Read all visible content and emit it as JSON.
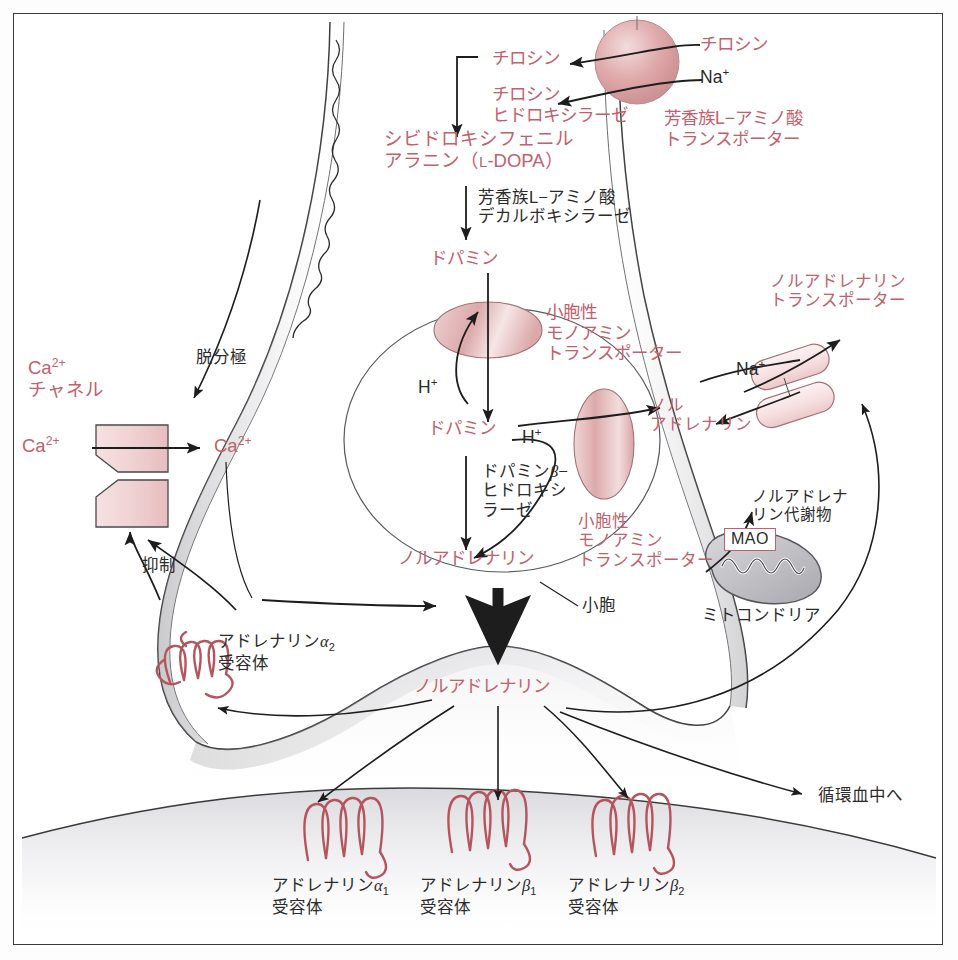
{
  "figure": {
    "type": "diagram",
    "accent_pink": "#c2606c",
    "ink": "#2b2b2b"
  },
  "labels": {
    "tyrosine_out": "チロシン",
    "sodium_out": "Na",
    "sodium_sup": "+",
    "tyrosine_in": "チロシン",
    "tyrosine_hydroxylase_l1": "チロシン",
    "tyrosine_hydroxylase_l2": "ヒドロキシラーゼ",
    "laat_l1": "芳香族L−アミノ酸",
    "laat_l2": "トランスポーター",
    "dopa_l1": "シビドロキシフェニル",
    "dopa_l2_a": "アラニン（",
    "dopa_l2_b": "L",
    "dopa_l2_c": "-DOPA）",
    "aadc_l1": "芳香族L−アミノ酸",
    "aadc_l2": "デカルボキシラーゼ",
    "dopamine_1": "ドパミン",
    "vmat_top_l1": "小胞性",
    "vmat_top_l2": "モノアミン",
    "vmat_top_l3": "トランスポーター",
    "proton_1": "H",
    "proton_1_sup": "+",
    "dopamine_2": "ドパミン",
    "dbh_l1_a": "ドパミン",
    "dbh_l1_b": "β",
    "dbh_l1_c": "−",
    "dbh_l2": "ヒドロキシ",
    "dbh_l3": "ラーゼ",
    "proton_2": "H",
    "proton_2_sup": "+",
    "vmat_bot_l1": "小胞性",
    "vmat_bot_l2": "モノアミン",
    "vmat_bot_l3": "トランスポーター",
    "na_inner": "Na",
    "na_inner_sup": "+",
    "nor_small_l1": "ノル",
    "nor_small_l2": "アドレナリン",
    "net_l1": "ノルアドレナリン",
    "net_l2": "トランスポーター",
    "na_metab_l1": "ノルアドレナ",
    "na_metab_l2": "リン代謝物",
    "mao": "MAO",
    "mitochondria": "ミトコンドリア",
    "vesicle": "小胞",
    "noradrenaline_vesicle": "ノルアドレナリン",
    "noradrenaline_cleft": "ノルアドレナリン",
    "depolarization": "脱分極",
    "ca_channel_l1_a": "Ca",
    "ca_channel_l1_sup": "2+",
    "ca_channel_l2": "チャネル",
    "ca_left": "Ca",
    "ca_left_sup": "2+",
    "ca_right": "Ca",
    "ca_right_sup": "2+",
    "inhibition": "抑制",
    "alpha2_l1_a": "アドレナリン",
    "alpha2_l1_b": "α",
    "alpha2_l1_sub": "2",
    "alpha2_l2": "受容体",
    "alpha1_l1_a": "アドレナリン",
    "alpha1_l1_b": "α",
    "alpha1_l1_sub": "1",
    "alpha1_l2": "受容体",
    "beta1_l1_a": "アドレナリン",
    "beta1_l1_b": "β",
    "beta1_l1_sub": "1",
    "beta1_l2": "受容体",
    "beta2_l1_a": "アドレナリン",
    "beta2_l1_b": "β",
    "beta2_l1_sub": "2",
    "beta2_l2": "受容体",
    "to_circulation": "循環血中へ"
  }
}
